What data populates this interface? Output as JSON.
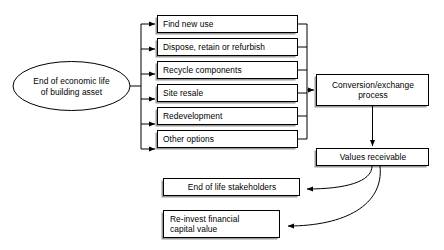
{
  "diagram": {
    "colors": {
      "stroke": "#000000",
      "fill": "#ffffff",
      "shadow": "#9a9a9a",
      "text": "#000000"
    },
    "start_node": {
      "shape": "ellipse",
      "label": "End of economic life\nof building asset"
    },
    "options": [
      {
        "label": "Find new use"
      },
      {
        "label": "Dispose, retain or refurbish"
      },
      {
        "label": "Recycle components"
      },
      {
        "label": "Site resale"
      },
      {
        "label": "Redevelopment"
      },
      {
        "label": "Other options"
      }
    ],
    "process_node": {
      "label": "Conversion/exchange\nprocess"
    },
    "values_node": {
      "label": "Values receivable"
    },
    "outcomes": [
      {
        "label": "End of life stakeholders",
        "align": "center"
      },
      {
        "label": "Re-invest financial\ncapital value",
        "align": "left"
      }
    ]
  }
}
